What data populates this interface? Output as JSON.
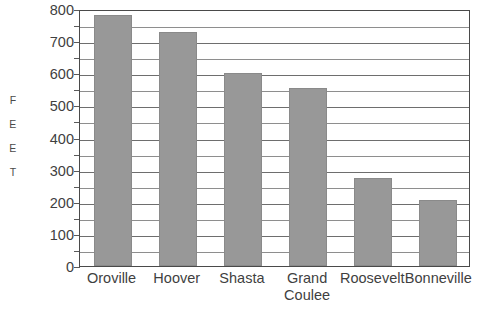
{
  "chart_data": {
    "type": "bar",
    "title": "",
    "xlabel": "",
    "ylabel": "FEET",
    "ylabel_letters": [
      "F",
      "E",
      "E",
      "T"
    ],
    "categories": [
      "Oroville",
      "Hoover",
      "Shasta",
      "Grand Coulee",
      "Roosevelt",
      "Bonneville"
    ],
    "category_lines": [
      [
        "Oroville"
      ],
      [
        "Hoover"
      ],
      [
        "Shasta"
      ],
      [
        "Grand",
        "Coulee"
      ],
      [
        "Roosevelt"
      ],
      [
        "Bonneville"
      ]
    ],
    "values": [
      780,
      730,
      602,
      555,
      275,
      205
    ],
    "ylim": [
      0,
      800
    ],
    "ytick_values": [
      800,
      700,
      600,
      500,
      400,
      300,
      200,
      100,
      0
    ],
    "ytick_labels": [
      "800",
      "700",
      "600",
      "500",
      "400",
      "300",
      "200",
      "100",
      "0"
    ],
    "gridline_step": 50,
    "grid": true,
    "legend": "none",
    "bar_color": "#989898",
    "bar_border_color": "#8a8a8a",
    "axis_color": "#4a4a4a",
    "grid_color": "#6e6e6e",
    "text_color": "#3f3f3f"
  }
}
